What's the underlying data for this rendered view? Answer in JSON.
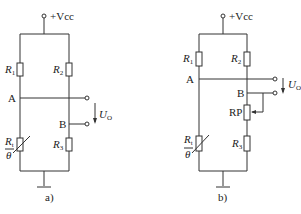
{
  "figure": {
    "panels": [
      {
        "id": "a",
        "caption": "a)",
        "supply_label": "+Vcc",
        "labels": {
          "r1": "R",
          "r1_sub": "1",
          "r2": "R",
          "r2_sub": "2",
          "r3": "R",
          "r3_sub": "3",
          "rt": "R",
          "rt_sub": "t",
          "theta": "θ",
          "node_a": "A",
          "node_b": "B",
          "output": "U",
          "output_sub": "O"
        }
      },
      {
        "id": "b",
        "caption": "b)",
        "supply_label": "+Vcc",
        "labels": {
          "r1": "R",
          "r1_sub": "1",
          "r2": "R",
          "r2_sub": "2",
          "r3": "R",
          "r3_sub": "3",
          "rt": "R",
          "rt_sub": "t",
          "theta": "θ",
          "rp": "RP",
          "node_a": "A",
          "node_b": "B",
          "output": "U",
          "output_sub": "O"
        }
      }
    ],
    "colors": {
      "line": "#333333",
      "text": "#222222",
      "background": "#ffffff"
    }
  }
}
